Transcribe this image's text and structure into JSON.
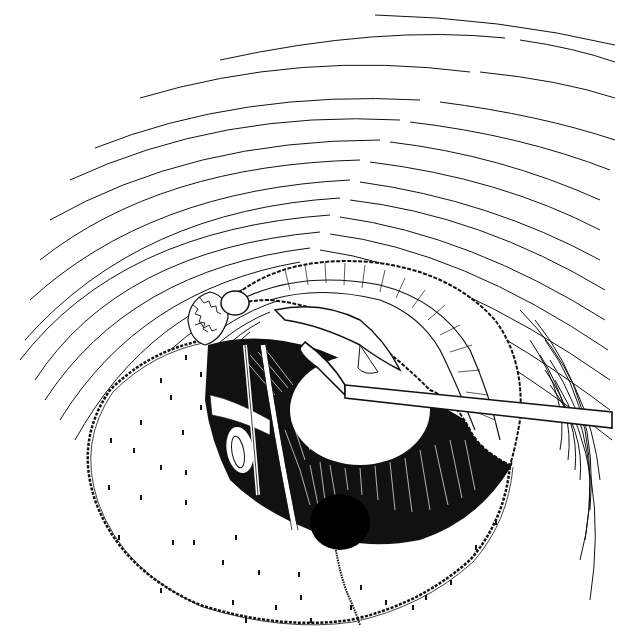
{
  "figure": {
    "style": "black-and-white pen drawing",
    "colors": {
      "ink": "#111111",
      "paper": "#ffffff"
    },
    "elements": [
      "concentric-canal-lines",
      "elevated-tympanomeatal-flap",
      "dotted-canal-skin-flap",
      "middle-ear-cavity",
      "instrument-shaft",
      "ossicle",
      "chorda-tympani"
    ]
  }
}
